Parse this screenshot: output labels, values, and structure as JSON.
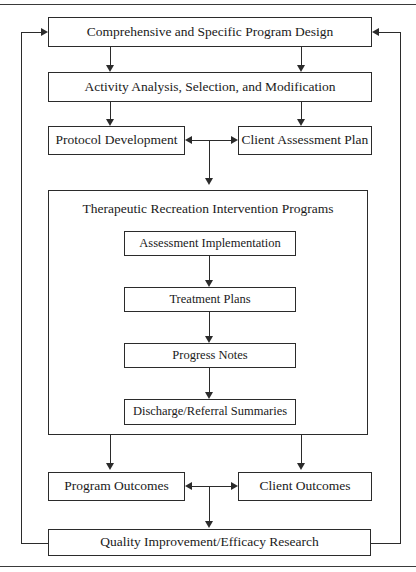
{
  "diagram": {
    "type": "flowchart",
    "title_rules": {
      "top_rule": true,
      "bottom_rule": true
    },
    "nodes": {
      "program_design": {
        "label": "Comprehensive and Specific Program Design",
        "x": 48,
        "y": 17,
        "w": 324,
        "h": 30,
        "font_size": 13.5
      },
      "activity_analysis": {
        "label": "Activity Analysis, Selection, and Modification",
        "x": 48,
        "y": 72,
        "w": 324,
        "h": 30,
        "font_size": 13.5
      },
      "protocol_dev": {
        "label": "Protocol Development",
        "x": 48,
        "y": 126,
        "w": 137,
        "h": 29,
        "font_size": 13.5
      },
      "client_assessment": {
        "label": "Client Assessment Plan",
        "x": 238,
        "y": 126,
        "w": 134,
        "h": 29,
        "font_size": 13.5
      },
      "tr_programs": {
        "label": "Therapeutic Recreation Intervention Programs",
        "x": 48,
        "y": 190,
        "w": 320,
        "h": 245,
        "font_size": 13.5
      },
      "assessment_impl": {
        "label": "Assessment Implementation",
        "x": 124,
        "y": 231,
        "w": 172,
        "h": 25,
        "font_size": 12.5
      },
      "treatment_plans": {
        "label": "Treatment Plans",
        "x": 124,
        "y": 287,
        "w": 172,
        "h": 25,
        "font_size": 12.5
      },
      "progress_notes": {
        "label": "Progress Notes",
        "x": 124,
        "y": 343,
        "w": 172,
        "h": 25,
        "font_size": 12.5
      },
      "discharge_ref": {
        "label": "Discharge/Referral Summaries",
        "x": 124,
        "y": 399,
        "w": 172,
        "h": 26,
        "font_size": 12.5
      },
      "program_outcomes": {
        "label": "Program Outcomes",
        "x": 48,
        "y": 472,
        "w": 137,
        "h": 29,
        "font_size": 13.5
      },
      "client_outcomes": {
        "label": "Client Outcomes",
        "x": 238,
        "y": 472,
        "w": 134,
        "h": 29,
        "font_size": 13.5
      },
      "quality_improve": {
        "label": "Quality Improvement/Efficacy Research",
        "x": 48,
        "y": 529,
        "w": 323,
        "h": 27,
        "font_size": 13.5
      }
    },
    "edges": [
      {
        "name": "program-design-to-activity-left",
        "from": "program_design",
        "to": "activity_analysis",
        "kind": "arrow-down"
      },
      {
        "name": "program-design-to-activity-right",
        "from": "program_design",
        "to": "activity_analysis",
        "kind": "arrow-down"
      },
      {
        "name": "activity-to-protocol",
        "from": "activity_analysis",
        "to": "protocol_dev",
        "kind": "arrow-down"
      },
      {
        "name": "activity-to-client-assessment",
        "from": "activity_analysis",
        "to": "client_assessment",
        "kind": "arrow-down"
      },
      {
        "name": "protocol-client-bidirectional",
        "from": "protocol_dev",
        "to": "client_assessment",
        "kind": "double-arrow-horizontal"
      },
      {
        "name": "junction-to-tr-programs",
        "from": "protocol_dev",
        "to": "tr_programs",
        "kind": "arrow-down"
      },
      {
        "name": "assessment-to-treatment",
        "from": "assessment_impl",
        "to": "treatment_plans",
        "kind": "arrow-down"
      },
      {
        "name": "treatment-to-progress",
        "from": "treatment_plans",
        "to": "progress_notes",
        "kind": "arrow-down"
      },
      {
        "name": "progress-to-discharge",
        "from": "progress_notes",
        "to": "discharge_ref",
        "kind": "arrow-down"
      },
      {
        "name": "tr-programs-to-program-outcomes",
        "from": "tr_programs",
        "to": "program_outcomes",
        "kind": "arrow-down"
      },
      {
        "name": "tr-programs-to-client-outcomes",
        "from": "tr_programs",
        "to": "client_outcomes",
        "kind": "arrow-down"
      },
      {
        "name": "outcomes-bidirectional",
        "from": "program_outcomes",
        "to": "client_outcomes",
        "kind": "double-arrow-horizontal"
      },
      {
        "name": "junction-to-quality",
        "from": "program_outcomes",
        "to": "quality_improve",
        "kind": "arrow-down"
      },
      {
        "name": "quality-feedback-left",
        "from": "quality_improve",
        "to": "program_design",
        "kind": "feedback-loop-left"
      },
      {
        "name": "quality-feedback-right",
        "from": "quality_improve",
        "to": "program_design",
        "kind": "feedback-loop-right"
      }
    ],
    "colors": {
      "stroke": "#2b2b2b",
      "text": "#1a1a1a",
      "background": "#ffffff",
      "rule": "#3a3a3a"
    }
  }
}
